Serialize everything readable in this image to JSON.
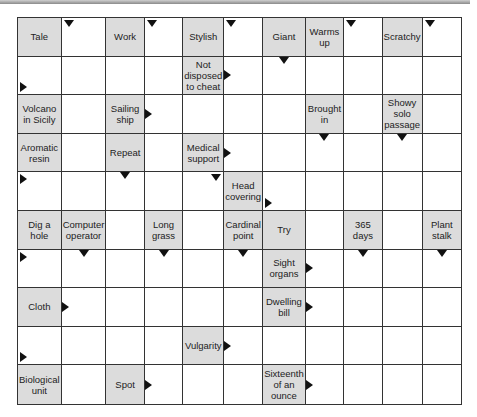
{
  "puzzle": {
    "type": "arrowword",
    "columns": 11,
    "rows": 10,
    "colors": {
      "clue_bg": "#dcdcdc",
      "cell_bg": "#ffffff",
      "grid_line": "#333333",
      "arrow": "#111111"
    },
    "clues": {
      "r0c0": "Tale",
      "r0c2": "Work",
      "r0c4": "Stylish",
      "r0c6": "Giant",
      "r0c7": "Warms up",
      "r0c9": "Scratchy",
      "r1c4": "Not disposed to cheat",
      "r2c0": "Volcano in Sicily",
      "r2c2": "Sailing ship",
      "r2c7": "Brought in",
      "r2c9": "Showy solo passage",
      "r3c0": "Aromatic resin",
      "r3c2": "Repeat",
      "r3c4": "Medical support",
      "r4c5": "Head covering",
      "r5c0": "Dig a hole",
      "r5c1": "Computer operator",
      "r5c3": "Long grass",
      "r5c5": "Cardinal point",
      "r5c6": "Try",
      "r5c8": "365 days",
      "r5c10": "Plant stalk",
      "r7c0": "Cloth",
      "r6c6": "Sight organs",
      "r7c6": "Dwelling bill",
      "r8c4": "Vulgarity",
      "r9c0": "Biological unit",
      "r9c2": "Spot",
      "r9c6": "Sixteenth of an ounce"
    }
  }
}
